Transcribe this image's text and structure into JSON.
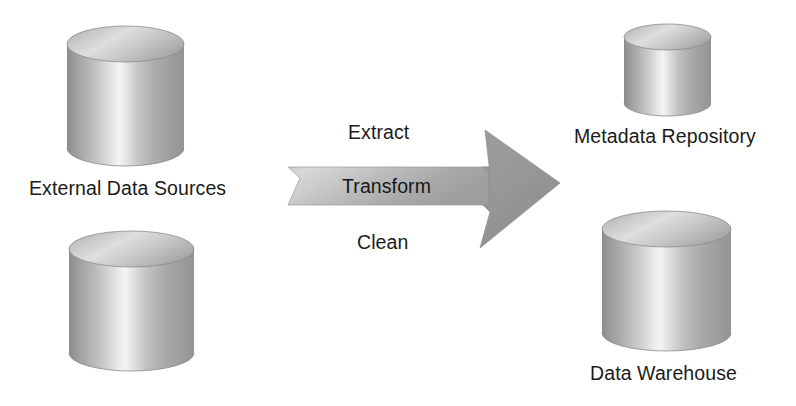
{
  "diagram": {
    "type": "data-flow-diagram",
    "background_color": "#ffffff",
    "text_color": "#1b1b1b"
  },
  "sources": {
    "label": "External Data Sources",
    "cylinders": [
      {
        "name": "external-data-source-upper",
        "x": 67,
        "y": 26,
        "width": 117,
        "height": 140
      },
      {
        "name": "external-data-source-lower",
        "x": 69,
        "y": 231,
        "width": 125,
        "height": 140
      }
    ]
  },
  "process": {
    "arrow_name": "etl-arrow",
    "steps": [
      {
        "key": "extract",
        "label": "Extract",
        "position": "above-arrow"
      },
      {
        "key": "transform",
        "label": "Transform",
        "position": "inside-arrow"
      },
      {
        "key": "clean",
        "label": "Clean",
        "position": "below-arrow"
      }
    ],
    "arrow_fill_light": "#d9d9d9",
    "arrow_fill_mid": "#a8a8a8",
    "arrow_fill_dark": "#8f8f8f"
  },
  "targets": [
    {
      "key": "metadata-repository",
      "label": "Metadata Repository",
      "cylinder": {
        "x": 624,
        "y": 24,
        "width": 87,
        "height": 92
      }
    },
    {
      "key": "data-warehouse",
      "label": "Data Warehouse",
      "cylinder": {
        "x": 602,
        "y": 211,
        "width": 129,
        "height": 140
      }
    }
  ],
  "colors": {
    "cylinder_edge": "#6f6f6f",
    "cylinder_highlight": "#f2f2f2",
    "cylinder_shadow": "#7c7c7c",
    "cylinder_top_light": "#e3e3e3",
    "cylinder_top_dark": "#9a9a9a"
  }
}
